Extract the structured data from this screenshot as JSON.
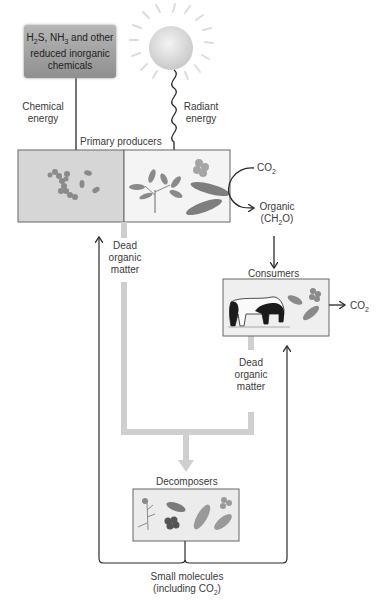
{
  "diagram": {
    "nodes": {
      "chemical_source": {
        "line1_pre": "H",
        "line1_sub1": "2",
        "line1_mid": "S, NH",
        "line1_sub2": "3",
        "line1_post": " and other",
        "line2": "reduced inorganic",
        "line3": "chemicals"
      },
      "sun": {
        "icon": "sun-icon"
      },
      "primary_producers": {
        "label": "Primary producers"
      },
      "consumers": {
        "label": "Consumers"
      },
      "decomposers": {
        "label": "Decomposers"
      }
    },
    "edges": {
      "chemical_energy": {
        "line1": "Chemical",
        "line2": "energy"
      },
      "radiant_energy": {
        "line1": "Radiant",
        "line2": "energy"
      },
      "co2_in": {
        "pre": "CO",
        "sub": "2"
      },
      "organic": {
        "line1": "Organic",
        "line2_pre": "(CH",
        "line2_sub": "2",
        "line2_post": "O)"
      },
      "consumer_co2": {
        "pre": "CO",
        "sub": "2"
      },
      "dead_matter_producers": {
        "line1": "Dead",
        "line2": "organic",
        "line3": "matter"
      },
      "dead_matter_consumers": {
        "line1": "Dead",
        "line2": "organic",
        "line3": "matter"
      },
      "small_molecules": {
        "line1": "Small molecules",
        "line2_pre": "(including CO",
        "line2_sub": "2",
        "line2_post": ")"
      }
    },
    "colors": {
      "box_left": "#d6d6d6",
      "box_right": "#f4f4f4",
      "organism": "#8a8a8a",
      "dead_matter_path": "#cfcfcf",
      "arrow": "#2a2a2a"
    }
  }
}
